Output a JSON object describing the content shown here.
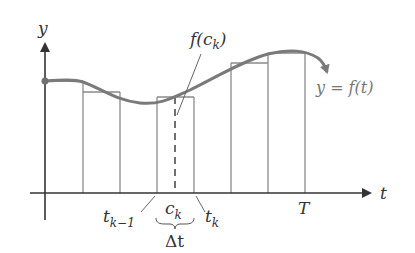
{
  "diagram": {
    "type": "riemann-sum-illustration",
    "axes": {
      "x_label": "t",
      "y_label": "y"
    },
    "curve_label": "y = f(t)",
    "sample_point_label": "f(c_k)",
    "sample_value_text": {
      "base": "f(c",
      "sub": "k",
      "close": ")"
    },
    "tick_labels": {
      "t_k_minus_1": {
        "base": "t",
        "sub": "k−1"
      },
      "c_k": {
        "base": "c",
        "sub": "k"
      },
      "t_k": {
        "base": "t",
        "sub": "k"
      },
      "T": "T"
    },
    "interval_label": "Δt",
    "partition_x": [
      45,
      83,
      120,
      157,
      194,
      231,
      268,
      305
    ],
    "rectangles": [
      {
        "x0": 45,
        "x1": 83,
        "top": 81
      },
      {
        "x0": 83,
        "x1": 120,
        "top": 92
      },
      {
        "x0": 157,
        "x1": 194,
        "top": 97
      },
      {
        "x0": 231,
        "x1": 268,
        "top": 63
      },
      {
        "x0": 268,
        "x1": 305,
        "top": 53
      }
    ],
    "colors": {
      "axis": "#333333",
      "curve": "#7a7a7a",
      "rect": "#8a8a8a",
      "text": "#333333"
    }
  }
}
